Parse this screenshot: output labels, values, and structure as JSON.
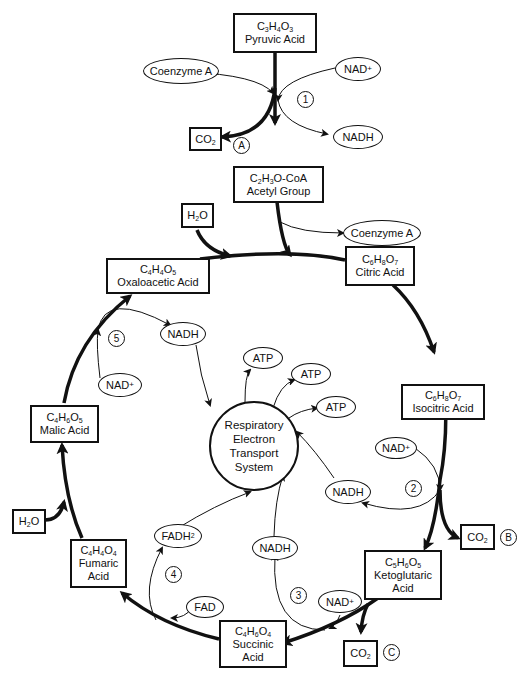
{
  "diagram": {
    "compounds": {
      "pyruvic": {
        "formula": "C3H4O3",
        "name": "Pyruvic Acid"
      },
      "acetyl": {
        "formula": "C2H3O-CoA",
        "name": "Acetyl Group"
      },
      "oxaloacetic": {
        "formula": "C4H4O5",
        "name": "Oxaloacetic Acid"
      },
      "citric": {
        "formula": "C6H8O7",
        "name": "Citric Acid"
      },
      "isocitric": {
        "formula": "C6H8O7",
        "name": "Isocitric Acid"
      },
      "ketoglutaric": {
        "formula": "C5H6O5",
        "name": "Ketoglutaric Acid"
      },
      "succinic": {
        "formula": "C4H6O4",
        "name": "Succinic Acid"
      },
      "fumaric": {
        "formula": "C4H4O4",
        "name": "Fumaric Acid"
      },
      "malic": {
        "formula": "C4H6O5",
        "name": "Malic Acid"
      }
    },
    "small_boxes": {
      "co2_a": "CO2",
      "co2_b": "CO2",
      "co2_c": "CO2",
      "h2o_top": "H2O",
      "h2o_left": "H2O"
    },
    "ovals": {
      "coenzyme_a_in": "Coenzyme A",
      "coenzyme_a_out": "Coenzyme A",
      "nad_1": "NAD+",
      "nadh_1": "NADH",
      "nad_2": "NAD+",
      "nadh_2": "NADH",
      "nad_3": "NAD+",
      "nadh_3": "NADH",
      "fad": "FAD",
      "fadh2": "FADH2",
      "nad_5": "NAD+",
      "nadh_5": "NADH",
      "atp_1": "ATP",
      "atp_2": "ATP",
      "atp_3": "ATP"
    },
    "center": {
      "line1": "Respiratory",
      "line2": "Electron",
      "line3": "Transport",
      "line4": "System"
    },
    "step_labels": [
      "1",
      "2",
      "3",
      "4",
      "5"
    ],
    "co2_labels": [
      "A",
      "B",
      "C"
    ]
  }
}
